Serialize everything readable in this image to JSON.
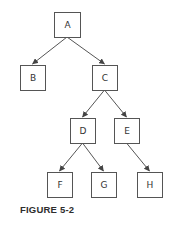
{
  "figure": {
    "caption": "FIGURE 5-2",
    "stroke_color": "#555555",
    "text_color": "#333333"
  },
  "nodes": {
    "A": {
      "label": "A",
      "x": 54,
      "y": 12,
      "w": 26,
      "h": 25
    },
    "B": {
      "label": "B",
      "x": 20,
      "y": 65,
      "w": 25,
      "h": 25
    },
    "C": {
      "label": "C",
      "x": 92,
      "y": 65,
      "w": 25,
      "h": 25
    },
    "D": {
      "label": "D",
      "x": 70,
      "y": 118,
      "w": 25,
      "h": 25
    },
    "E": {
      "label": "E",
      "x": 114,
      "y": 118,
      "w": 25,
      "h": 25
    },
    "F": {
      "label": "F",
      "x": 47,
      "y": 172,
      "w": 25,
      "h": 25
    },
    "G": {
      "label": "G",
      "x": 91,
      "y": 172,
      "w": 25,
      "h": 25
    },
    "H": {
      "label": "H",
      "x": 137,
      "y": 172,
      "w": 25,
      "h": 25
    }
  },
  "edges": [
    {
      "from": "A",
      "to": "B"
    },
    {
      "from": "A",
      "to": "C"
    },
    {
      "from": "C",
      "to": "D"
    },
    {
      "from": "C",
      "to": "E"
    },
    {
      "from": "D",
      "to": "F"
    },
    {
      "from": "D",
      "to": "G"
    },
    {
      "from": "E",
      "to": "H"
    }
  ]
}
